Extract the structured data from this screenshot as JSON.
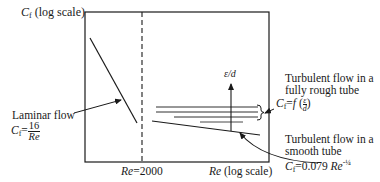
{
  "diagram": {
    "type": "friction-factor-vs-reynolds-schematic",
    "y_axis": {
      "symbol": "C",
      "subscript": "f",
      "scale_note": "(log scale)"
    },
    "x_axis": {
      "symbol": "Re",
      "scale_note": "(log scale)"
    },
    "transition": {
      "symbol": "Re",
      "equals": "=2000"
    },
    "laminar": {
      "label": "Laminar flow",
      "formula_lhs_symbol": "C",
      "formula_lhs_sub": "f",
      "formula_eq": "=",
      "formula_num": "16",
      "formula_den": "Re"
    },
    "roughness_arrow_label": "ε/d",
    "rough_tube": {
      "label_line1": "Turbulent flow in a",
      "label_line2": "fully rough tube",
      "formula_lhs_symbol": "C",
      "formula_lhs_sub": "f",
      "formula_eq": "=",
      "formula_func": "f",
      "formula_num": "ε",
      "formula_den": "d"
    },
    "smooth_tube": {
      "label_line1": "Turbulent flow in a",
      "label_line2": "smooth tube",
      "formula_lhs_symbol": "C",
      "formula_lhs_sub": "f",
      "formula_eq": "=0.079",
      "formula_var": "Re",
      "formula_exp": "-¼"
    },
    "colors": {
      "ink": "#1a1a1a",
      "background": "#ffffff"
    }
  }
}
